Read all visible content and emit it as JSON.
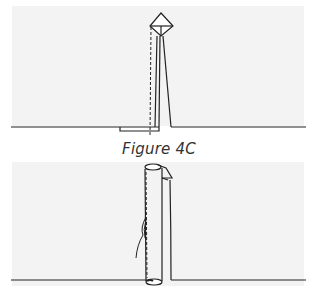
{
  "figure": {
    "caption": "Figure 4C",
    "top_diagram": "seam-fold-with-point",
    "bottom_diagram": "rolled-seam-with-thread"
  }
}
